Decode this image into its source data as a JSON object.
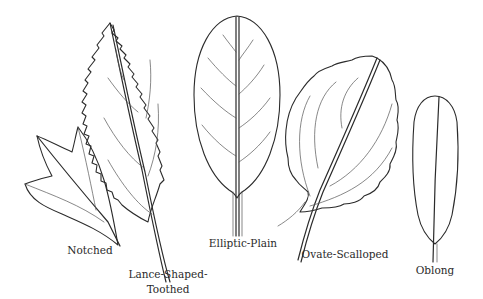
{
  "figure": {
    "type": "botanical-illustration",
    "leaves": [
      {
        "id": "notched",
        "label": "Notched"
      },
      {
        "id": "lance",
        "label_line1": "Lance-Shaped-",
        "label_line2": "Toothed"
      },
      {
        "id": "elliptic",
        "label": "Elliptic-Plain"
      },
      {
        "id": "ovate",
        "label": "Ovate-Scalloped"
      },
      {
        "id": "oblong",
        "label": "Oblong"
      }
    ],
    "colors": {
      "ink": "#2b2b2b",
      "background": "#ffffff"
    }
  }
}
